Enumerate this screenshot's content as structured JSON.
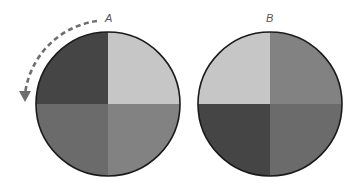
{
  "diagram": {
    "colors": {
      "dark": "#454545",
      "medium": "#6b6b6b",
      "medium_light": "#828282",
      "light": "#c6c6c6",
      "outline": "#1a1a1a",
      "arrow": "#6e6e6e"
    },
    "circles": [
      {
        "label": "A",
        "center": [
          108,
          104
        ],
        "radius": 72,
        "quadrants": {
          "top_left": "dark",
          "top_right": "light",
          "bottom_left": "medium",
          "bottom_right": "medium_light"
        }
      },
      {
        "label": "B",
        "center": [
          270,
          104
        ],
        "radius": 72,
        "quadrants": {
          "top_left": "light",
          "top_right": "medium_light",
          "bottom_left": "dark",
          "bottom_right": "medium"
        }
      }
    ],
    "arrow": {
      "style": "dashed",
      "direction": "counterclockwise",
      "around": "A"
    }
  }
}
